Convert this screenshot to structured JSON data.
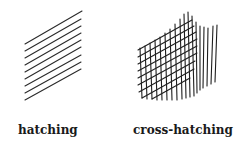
{
  "panels": [
    {
      "label": "hatching",
      "technique": "parallel-lines"
    },
    {
      "label": "cross-hatching",
      "technique": "crossed-lines"
    }
  ],
  "colors": {
    "ink": "#1a1a1a",
    "background": "#ffffff"
  }
}
